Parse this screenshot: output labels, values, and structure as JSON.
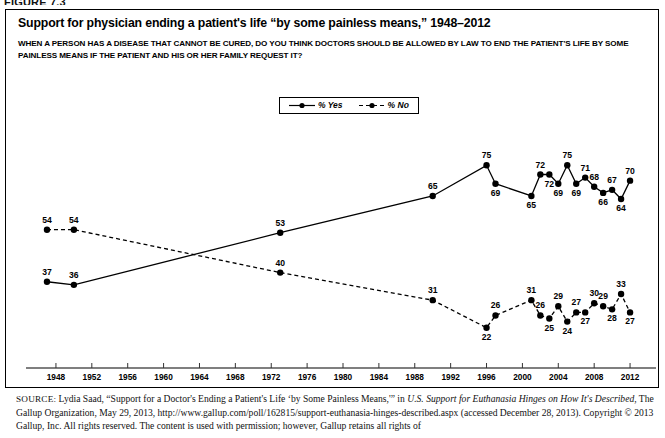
{
  "figure": {
    "label": "FIGURE 7.3"
  },
  "chart_title": "Support for physician ending a patient's life “by some painless means,” 1948–2012",
  "chart_question": "WHEN A PERSON HAS A DISEASE THAT CANNOT BE CURED, DO YOU THINK DOCTORS SHOULD BE ALLOWED BY LAW TO END THE PATIENT'S LIFE BY SOME PAINLESS MEANS IF THE PATIENT AND HIS OR HER FAMILY REQUEST IT?",
  "legend": {
    "position": "top-center",
    "entries": [
      {
        "label": "% Yes",
        "style": "solid",
        "marker": "filled-circle",
        "color": "#000000"
      },
      {
        "label": "% No",
        "style": "dashed",
        "marker": "filled-circle",
        "color": "#000000"
      }
    ]
  },
  "source": {
    "prefix": "SOURCE:",
    "line1_a": " Lydia Saad, “Support for a Doctor's Ending a Patient's Life ‘by Some Painless Means,'” in ",
    "line1_italic": "U.S. Support for Euthanasia Hinges on How It's Described",
    "line2_a": ", The Gallup Organization, May 29, 2013, http://www.gallup.com/poll/162815/support-euthanasia-hinges-described.aspx (accessed December 28, 2013). Copyright © 2013 Gallup, Inc. All rights reserved. The content is used with permission; however, Gallup retains all rights of"
  },
  "chart_data": {
    "type": "line",
    "title": "Support for physician ending a patient's life “by some painless means,” 1948–2012",
    "xlabel": "",
    "ylabel": "",
    "xlim": [
      1946,
      2014
    ],
    "ylim": [
      18,
      80
    ],
    "grid": false,
    "legend_position": "top-center",
    "xticks": [
      1948,
      1952,
      1956,
      1960,
      1964,
      1968,
      1972,
      1976,
      1980,
      1984,
      1988,
      1992,
      1996,
      2000,
      2004,
      2008,
      2012
    ],
    "series": [
      {
        "name": "% Yes",
        "style": "solid",
        "points": [
          {
            "x": 1947,
            "y": 37
          },
          {
            "x": 1950,
            "y": 36
          },
          {
            "x": 1973,
            "y": 53
          },
          {
            "x": 1990,
            "y": 65
          },
          {
            "x": 1996,
            "y": 75
          },
          {
            "x": 1997,
            "y": 69
          },
          {
            "x": 2001,
            "y": 65
          },
          {
            "x": 2002,
            "y": 72
          },
          {
            "x": 2003,
            "y": 72
          },
          {
            "x": 2004,
            "y": 69
          },
          {
            "x": 2005,
            "y": 75
          },
          {
            "x": 2006,
            "y": 69
          },
          {
            "x": 2007,
            "y": 71
          },
          {
            "x": 2008,
            "y": 68
          },
          {
            "x": 2009,
            "y": 66
          },
          {
            "x": 2010,
            "y": 67
          },
          {
            "x": 2011,
            "y": 64
          },
          {
            "x": 2012,
            "y": 70
          }
        ]
      },
      {
        "name": "% No",
        "style": "dashed",
        "points": [
          {
            "x": 1947,
            "y": 54
          },
          {
            "x": 1950,
            "y": 54
          },
          {
            "x": 1973,
            "y": 40
          },
          {
            "x": 1990,
            "y": 31
          },
          {
            "x": 1996,
            "y": 22
          },
          {
            "x": 1997,
            "y": 26
          },
          {
            "x": 2001,
            "y": 31
          },
          {
            "x": 2002,
            "y": 26
          },
          {
            "x": 2003,
            "y": 25
          },
          {
            "x": 2004,
            "y": 29
          },
          {
            "x": 2005,
            "y": 24
          },
          {
            "x": 2006,
            "y": 27
          },
          {
            "x": 2007,
            "y": 27
          },
          {
            "x": 2008,
            "y": 30
          },
          {
            "x": 2009,
            "y": 29
          },
          {
            "x": 2010,
            "y": 28
          },
          {
            "x": 2011,
            "y": 33
          },
          {
            "x": 2012,
            "y": 27
          }
        ]
      }
    ],
    "label_offsets": {
      "yes": [
        "above",
        "above",
        "above",
        "above",
        "above",
        "below",
        "below",
        "above",
        "below",
        "below",
        "above",
        "below",
        "above",
        "above",
        "below",
        "above",
        "below",
        "above"
      ],
      "no": [
        "above",
        "above",
        "above",
        "above",
        "below",
        "above",
        "above",
        "above",
        "below",
        "above",
        "below",
        "above",
        "below",
        "above",
        "above",
        "below",
        "above",
        "below"
      ]
    }
  }
}
